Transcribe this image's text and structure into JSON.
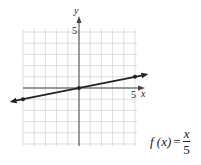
{
  "chart_data": {
    "type": "line",
    "title": "",
    "xlabel": "x",
    "ylabel": "y",
    "xlim": [
      -5,
      5
    ],
    "ylim": [
      -5,
      5
    ],
    "grid": true,
    "tick_labels": {
      "x": [
        "5"
      ],
      "y": [
        "5"
      ]
    },
    "series": [
      {
        "name": "f(x) = x/5",
        "x": [
          -5,
          0,
          5
        ],
        "y": [
          -1,
          0,
          1
        ],
        "marked_points": [
          [
            -5,
            -1
          ],
          [
            0,
            0
          ],
          [
            5,
            1
          ]
        ],
        "arrows_both_ends": true
      }
    ],
    "annotation": "f(x) = x/5"
  },
  "labels": {
    "x_axis": "x",
    "y_axis": "y",
    "x_tick": "5",
    "y_tick": "5"
  },
  "formula": {
    "lhs": "f (x)",
    "eq": "=",
    "numerator": "x",
    "denominator": "5"
  },
  "colors": {
    "grid": "#d4d4d4",
    "axis": "#444444",
    "line": "#222222"
  }
}
